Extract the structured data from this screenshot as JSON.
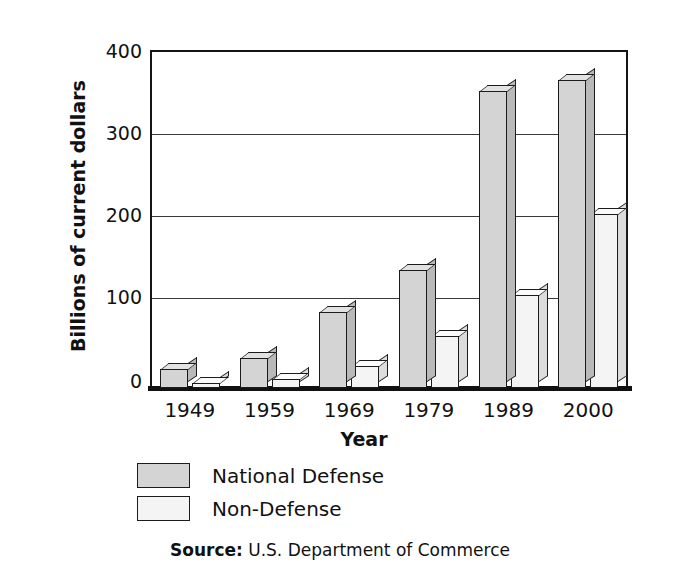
{
  "chart_data": {
    "type": "bar",
    "title": "",
    "xlabel": "Year",
    "ylabel": "Billions of current dollars",
    "categories": [
      "1949",
      "1959",
      "1969",
      "1979",
      "1989",
      "2000"
    ],
    "series": [
      {
        "name": "National Defense",
        "color": "#d4d4d4",
        "values": [
          23,
          37,
          93,
          144,
          362,
          376
        ]
      },
      {
        "name": "Non-Defense",
        "color": "#f4f4f4",
        "values": [
          6,
          11,
          27,
          64,
          114,
          212
        ]
      }
    ],
    "ylim": [
      0,
      400
    ],
    "yticks": [
      "0",
      "100",
      "200",
      "300",
      "400"
    ],
    "ytick_values": [
      0,
      100,
      200,
      300,
      400
    ],
    "grid": true,
    "legend_position": "below-plot"
  },
  "axes": {
    "y_title": "Billions of current dollars",
    "x_title": "Year"
  },
  "legend": {
    "entries": [
      {
        "label": "National Defense",
        "swatch": "#d4d4d4"
      },
      {
        "label": "Non-Defense",
        "swatch": "#f4f4f4"
      }
    ]
  },
  "source": {
    "prefix": "Source:",
    "text": " U.S. Department of Commerce"
  }
}
